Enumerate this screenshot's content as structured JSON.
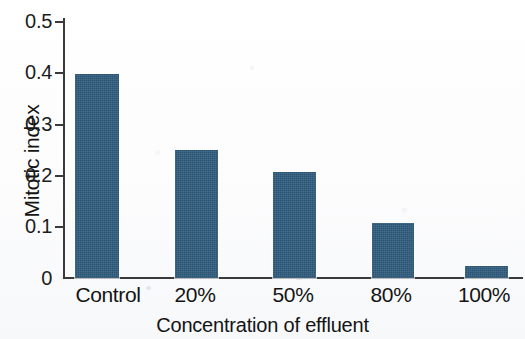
{
  "chart_data": {
    "type": "bar",
    "title": "",
    "xlabel": "Concentration of effluent",
    "ylabel": "Mitotic index",
    "categories": [
      "Control",
      "20%",
      "50%",
      "80%",
      "100%"
    ],
    "values": [
      0.39,
      0.245,
      0.203,
      0.105,
      0.023
    ],
    "ylim": [
      0,
      0.5
    ],
    "yticks": [
      "0",
      "0.1",
      "0.2",
      "0.3",
      "0.4",
      "0.5"
    ],
    "ytick_values": [
      0,
      0.1,
      0.2,
      0.3,
      0.4,
      0.5
    ],
    "grid": false,
    "legend": null,
    "bar_color": "#2f5c7e",
    "axis_color": "#3a3a3a",
    "background_color": "#fdfdfd"
  }
}
